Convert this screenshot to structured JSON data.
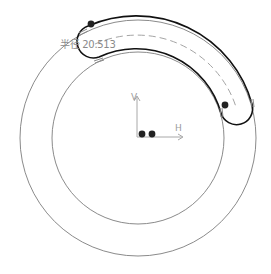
{
  "sketch": {
    "origin": {
      "x": 137,
      "y": 137
    },
    "outer_circle": {
      "cx": 138,
      "cy": 138,
      "r": 118,
      "color": "#7a7a7a"
    },
    "inner_circle": {
      "cx": 138,
      "cy": 138,
      "r": 86,
      "color": "#7a7a7a"
    },
    "slot": {
      "cx": 138,
      "cy": 138,
      "outer_r": 120,
      "inner_r": 88,
      "center_r": 104,
      "start_angle_deg": 205,
      "end_angle_deg": 343,
      "color": "#111111",
      "centerline_color": "#9a9a9a"
    },
    "dimension": {
      "label": "半径 20.513",
      "x": 60,
      "y": 41
    },
    "axes": {
      "h_label": "H",
      "v_label": "V",
      "color": "#a0a0a0"
    },
    "points": [
      {
        "name": "slot-start-point",
        "x": 91,
        "y": 24
      },
      {
        "name": "slot-end-point",
        "x": 225,
        "y": 105
      },
      {
        "name": "origin-point-1",
        "x": 142,
        "y": 134
      },
      {
        "name": "origin-point-2",
        "x": 152,
        "y": 134
      }
    ]
  }
}
